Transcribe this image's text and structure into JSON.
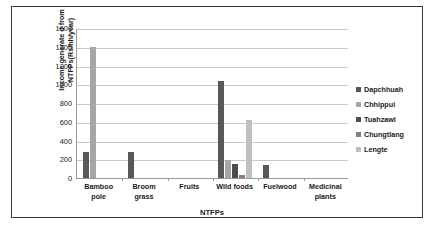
{
  "chart_data": {
    "type": "bar",
    "title": "",
    "xlabel": "NTFPs",
    "ylabel": "Income generate d from NTFPs(Rs/hh/year)",
    "ylabel_lines": [
      "Income generate d from",
      "NTFPs(Rs/hh/year)"
    ],
    "ylim": [
      0,
      1600
    ],
    "yticks": [
      1600,
      1400,
      1200,
      1000,
      800,
      600,
      400,
      200,
      0
    ],
    "ytick_labels": [
      "1600",
      "1400",
      "1200",
      "1000",
      "800",
      "600",
      "400",
      "200",
      "0"
    ],
    "grid": true,
    "legend_position": "right",
    "categories": [
      "Bamboo pole",
      "Broom grass",
      "Fruits",
      "Wild foods",
      "Fuelwood",
      "Medicinal plants"
    ],
    "category_lines": [
      [
        "Bamboo",
        "pole"
      ],
      [
        "Broom",
        "grass"
      ],
      [
        "Fruits",
        ""
      ],
      [
        "Wild foods",
        ""
      ],
      [
        "Fuelwood",
        ""
      ],
      [
        "Medicinal",
        "plants"
      ]
    ],
    "series": [
      {
        "name": "Dapchhuah",
        "color": "#595959",
        "values": [
          280,
          280,
          0,
          1030,
          140,
          0
        ]
      },
      {
        "name": "Chhippui",
        "color": "#a6a6a6",
        "values": [
          1400,
          0,
          0,
          190,
          0,
          0
        ]
      },
      {
        "name": "Tuahzawl",
        "color": "#4d4d4d",
        "values": [
          0,
          0,
          0,
          150,
          0,
          0
        ]
      },
      {
        "name": "Chungtlang",
        "color": "#808080",
        "values": [
          0,
          0,
          0,
          30,
          0,
          0
        ]
      },
      {
        "name": "Lengte",
        "color": "#bfbfbf",
        "values": [
          0,
          0,
          0,
          620,
          0,
          0
        ]
      }
    ]
  },
  "legend": {
    "items": [
      {
        "label": "Dapchhuah",
        "color": "#595959"
      },
      {
        "label": "Chhippui",
        "color": "#a6a6a6"
      },
      {
        "label": "Tuahzawl",
        "color": "#4d4d4d"
      },
      {
        "label": "Chungtlang",
        "color": "#808080"
      },
      {
        "label": "Lengte",
        "color": "#bfbfbf"
      }
    ]
  }
}
